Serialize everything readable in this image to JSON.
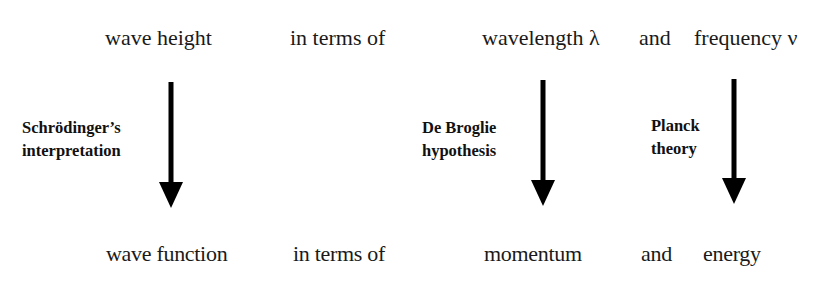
{
  "diagram": {
    "top_row": {
      "wave_height": "wave height",
      "in_terms_of": "in terms of",
      "wavelength": "wavelength λ",
      "and": "and",
      "frequency": "frequency ν"
    },
    "bottom_row": {
      "wave_function": "wave function",
      "in_terms_of": "in terms of",
      "momentum": "momentum",
      "and": "and",
      "energy": "energy"
    },
    "arrows": [
      {
        "label_line1": "Schrödinger’s",
        "label_line2": "interpretation",
        "icon": "down-arrow-icon"
      },
      {
        "label_line1": "De Broglie",
        "label_line2": "hypothesis",
        "icon": "down-arrow-icon"
      },
      {
        "label_line1": "Planck",
        "label_line2": "theory",
        "icon": "down-arrow-icon"
      }
    ],
    "colors": {
      "text": "#1a1a1a",
      "arrow": "#000000",
      "background": "#ffffff"
    }
  }
}
